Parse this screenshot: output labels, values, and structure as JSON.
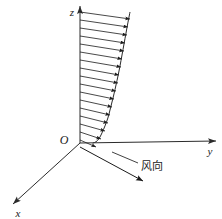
{
  "figure": {
    "background_color": "#ffffff",
    "stroke_color": "#2b2b2b",
    "width": 222,
    "height": 219
  },
  "axes": {
    "z": {
      "label": "z",
      "label_x": 72,
      "label_y": 13,
      "start_x": 80,
      "start_y": 143,
      "end_x": 80,
      "end_y": 6
    },
    "y": {
      "label": "y",
      "label_x": 210,
      "label_y": 152,
      "start_x": 80,
      "start_y": 143,
      "end_x": 216,
      "end_y": 141
    },
    "x": {
      "label": "x",
      "label_x": 18,
      "label_y": 214,
      "start_x": 80,
      "start_y": 143,
      "end_x": 13,
      "end_y": 204
    }
  },
  "origin": {
    "label": "O",
    "label_x": 64,
    "label_y": 141
  },
  "wind_annotation": {
    "label": "风向",
    "label_x": 141,
    "label_y": 167,
    "leader_from_x": 138,
    "leader_from_y": 163,
    "leader_to_x": 112,
    "leader_to_y": 152
  },
  "wind_arrow": {
    "start_x": 80,
    "start_y": 147,
    "end_x": 143,
    "end_y": 181
  },
  "chart_data": {
    "type": "line",
    "title": "",
    "xlabel": "y",
    "ylabel": "z",
    "grid": false,
    "legend": false,
    "profile_curve_points": [
      [
        130,
        12
      ],
      [
        128,
        22
      ],
      [
        126,
        33
      ],
      [
        124,
        44
      ],
      [
        122,
        55
      ],
      [
        120,
        66
      ],
      [
        118,
        76
      ],
      [
        116,
        85
      ],
      [
        114,
        94
      ],
      [
        112,
        102
      ],
      [
        110,
        110
      ],
      [
        108,
        118
      ],
      [
        105,
        126
      ],
      [
        102,
        133
      ],
      [
        99,
        139
      ],
      [
        96,
        142
      ],
      [
        93,
        143
      ]
    ],
    "arrow_rows": [
      {
        "z": 12,
        "tip_x": 130,
        "base_x": 80
      },
      {
        "z": 20,
        "tip_x": 128,
        "base_x": 80
      },
      {
        "z": 28,
        "tip_x": 127,
        "base_x": 80
      },
      {
        "z": 36,
        "tip_x": 125,
        "base_x": 80
      },
      {
        "z": 44,
        "tip_x": 124,
        "base_x": 80
      },
      {
        "z": 52,
        "tip_x": 122,
        "base_x": 80
      },
      {
        "z": 60,
        "tip_x": 121,
        "base_x": 80
      },
      {
        "z": 68,
        "tip_x": 119,
        "base_x": 80
      },
      {
        "z": 76,
        "tip_x": 118,
        "base_x": 80
      },
      {
        "z": 84,
        "tip_x": 116,
        "base_x": 80
      },
      {
        "z": 92,
        "tip_x": 114,
        "base_x": 80
      },
      {
        "z": 100,
        "tip_x": 112,
        "base_x": 80
      },
      {
        "z": 108,
        "tip_x": 110,
        "base_x": 80
      },
      {
        "z": 116,
        "tip_x": 108,
        "base_x": 80
      },
      {
        "z": 124,
        "tip_x": 105,
        "base_x": 80
      },
      {
        "z": 132,
        "tip_x": 101,
        "base_x": 80
      },
      {
        "z": 140,
        "tip_x": 96,
        "base_x": 80
      }
    ],
    "arrow_slant_dy": 7
  }
}
